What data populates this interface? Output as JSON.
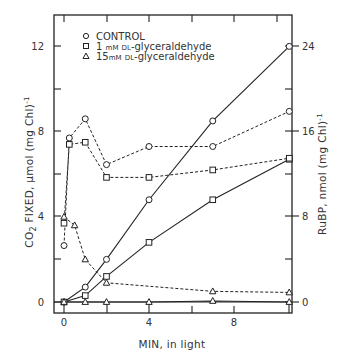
{
  "chart_data": {
    "type": "line",
    "title": "",
    "xlabel": "MIN, in light",
    "ylabel": "CO2 FIXED, μmol (mg Chl)⁻¹",
    "ylabel_right": "RuBP, nmol (mg Chl)⁻¹",
    "xlim": [
      -0.5,
      10.9
    ],
    "ylim": [
      -0.5,
      13.5
    ],
    "ylim_right": [
      -1,
      27
    ],
    "x_ticks": [
      0,
      2,
      4,
      6,
      8,
      10
    ],
    "x_tick_labels": [
      "0",
      "",
      "4",
      "",
      "8",
      ""
    ],
    "y_ticks": [
      0,
      2,
      4,
      6,
      8,
      10,
      12
    ],
    "y_tick_labels": [
      "0",
      "",
      "4",
      "",
      "8",
      "",
      "12"
    ],
    "y_right_ticks": [
      0,
      4,
      8,
      12,
      16,
      20,
      24
    ],
    "y_right_tick_labels": [
      "0",
      "",
      "8",
      "",
      "16",
      "",
      "24"
    ],
    "grid": false,
    "legend_position": "upper-left",
    "legend": [
      {
        "marker": "circle",
        "label": "CONTROL"
      },
      {
        "marker": "square",
        "label": "1 mM DL-glyceraldehyde"
      },
      {
        "marker": "triangle",
        "label": "15 mM DL-glyceraldehyde"
      }
    ],
    "series": [
      {
        "name": "CONTROL - CO2 fixed",
        "marker": "circle",
        "line": "solid",
        "axis": "left",
        "x": [
          0,
          1,
          2,
          4,
          7,
          10.6
        ],
        "y": [
          0,
          0.7,
          2.0,
          4.8,
          8.5,
          12.0
        ]
      },
      {
        "name": "1 mM DL-glyceraldehyde - CO2 fixed",
        "marker": "square",
        "line": "solid",
        "axis": "left",
        "x": [
          0,
          1,
          2,
          4,
          7,
          10.6
        ],
        "y": [
          0,
          0.3,
          1.2,
          2.8,
          4.8,
          6.7
        ]
      },
      {
        "name": "15 mM DL-glyceraldehyde - CO2 fixed",
        "marker": "triangle",
        "line": "solid",
        "axis": "left",
        "x": [
          0,
          1,
          2,
          4,
          7,
          10.6
        ],
        "y": [
          0,
          0,
          0,
          0,
          0.05,
          0
        ]
      },
      {
        "name": "CONTROL - RuBP",
        "marker": "circle",
        "line": "dashed",
        "axis": "right",
        "x": [
          0,
          0.25,
          1,
          2,
          4,
          7,
          10.6
        ],
        "y": [
          5.3,
          15.4,
          17.2,
          12.9,
          14.6,
          14.6,
          17.9
        ]
      },
      {
        "name": "1 mM DL-glyceraldehyde - RuBP",
        "marker": "square",
        "line": "dashed",
        "axis": "right",
        "x": [
          0,
          0.25,
          1,
          2,
          4,
          7,
          10.6
        ],
        "y": [
          7.4,
          14.8,
          15.0,
          11.7,
          11.7,
          12.4,
          13.5
        ]
      },
      {
        "name": "15 mM DL-glyceraldehyde - RuBP",
        "marker": "triangle",
        "line": "dashed",
        "axis": "right",
        "x": [
          0,
          0.5,
          1,
          2,
          7,
          10.6
        ],
        "y": [
          8.0,
          7.2,
          4.0,
          1.8,
          1.0,
          0.9
        ]
      }
    ]
  },
  "legend": {
    "control": "CONTROL",
    "one_mm_num": "1",
    "one_mm_unit": "mM",
    "one_mm_prefix": "DL",
    "one_mm_rest": "-glyceraldehyde",
    "fifteen_mm_num": "15",
    "fifteen_mm_unit": "mM",
    "fifteen_mm_prefix": "DL",
    "fifteen_mm_rest": "-glyceraldehyde"
  },
  "axes": {
    "x_title": "MIN, in light",
    "y_left_title_a": "CO",
    "y_left_title_sub": "2",
    "y_left_title_b": " FIXED, μmol (mg Chl)",
    "y_left_title_sup": "-1",
    "y_right_title_a": "RuBP, nmol (mg Chl)",
    "y_right_title_sup": "-1",
    "x_labels": [
      "0",
      "4",
      "8"
    ],
    "y_left_labels": [
      "0",
      "4",
      "8",
      "12"
    ],
    "y_right_labels": [
      "0",
      "8",
      "16",
      "24"
    ]
  }
}
